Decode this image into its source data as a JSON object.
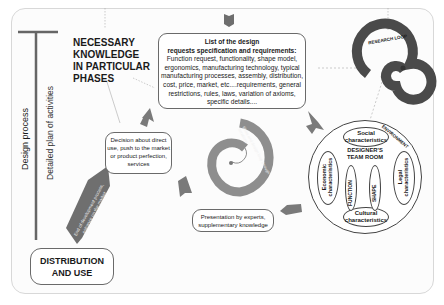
{
  "axis": {
    "design_process": "Design process",
    "detailed_plan": "Detailed plan of activities"
  },
  "knowledge": {
    "lines": [
      "NECESSARY",
      "KNOWLEDGE",
      "IN PARTICULAR",
      "PHASES"
    ]
  },
  "spec": {
    "title_1": "List of the design",
    "title_2": "requests specification and requirements:",
    "body": "Function request, functionality, shape model, ergonomics, manufacturing technology, typical manufacturing processes, assembly, distribution, cost, price, market, etc....requirements, general restrictions, rules, laws, variation of axioms, specific details...."
  },
  "research_loop": {
    "label": "RESEARCH LOOP"
  },
  "environment": {
    "label": "ENVIRONMENT",
    "social": "Social characteristics",
    "economic": "Economic characteristics",
    "legal": "Legal characteristics",
    "cultural": "Cultural characteristics",
    "team_room": "DESIGNER'S TEAM ROOM",
    "function": "FUNCTION",
    "shape": "SHAPE"
  },
  "decision": {
    "text": "Decision about direct use, push to the market or product perfection, services"
  },
  "presentation": {
    "text": "Presentation by experts, supplementary knowledge"
  },
  "end_ribbon": {
    "text": "End of development process, entrance on the market"
  },
  "spiral": {
    "text": "Ideas and design loop through iterations"
  },
  "distribution": {
    "lines": [
      "DISTRIBUTION",
      "AND USE"
    ]
  },
  "colors": {
    "arrow": "#7a7a7a",
    "spiral": "#8e8e8e",
    "research_loop": "#4a4a4a",
    "ribbon": "#6f6f6f"
  }
}
